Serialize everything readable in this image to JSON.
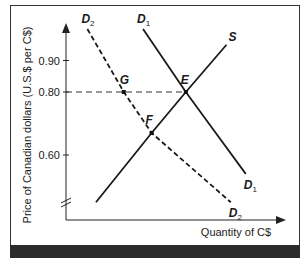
{
  "chart_data": {
    "type": "line",
    "title": "",
    "xlabel": "Quantity of C$",
    "ylabel": "Price of Canadian dollars (U.S.$ per C$)",
    "y_ticks": [
      {
        "value": 0.9,
        "label": "0.90"
      },
      {
        "value": 0.8,
        "label": "0.80"
      },
      {
        "value": 0.6,
        "label": "0.60"
      }
    ],
    "y_axis_break": true,
    "ylim": [
      0.43,
      1.0
    ],
    "xlim": [
      0,
      10
    ],
    "grid": false,
    "series": [
      {
        "name": "D2",
        "label_main": "D",
        "label_sub": "2",
        "style": "dashed",
        "points": [
          [
            1.0,
            1.0
          ],
          [
            2.7,
            0.8
          ],
          [
            4.0,
            0.67
          ],
          [
            7.7,
            0.45
          ]
        ]
      },
      {
        "name": "D1",
        "label_main": "D",
        "label_sub": "1",
        "style": "solid",
        "points": [
          [
            3.6,
            1.0
          ],
          [
            5.6,
            0.8
          ],
          [
            7.0,
            0.67
          ],
          [
            8.4,
            0.54
          ]
        ]
      },
      {
        "name": "S",
        "label_main": "S",
        "label_sub": "",
        "style": "solid",
        "points": [
          [
            1.4,
            0.45
          ],
          [
            4.0,
            0.67
          ],
          [
            5.6,
            0.8
          ],
          [
            7.5,
            0.95
          ]
        ]
      }
    ],
    "points": [
      {
        "name": "G",
        "x": 2.7,
        "y": 0.8
      },
      {
        "name": "E",
        "x": 5.6,
        "y": 0.8
      },
      {
        "name": "F",
        "x": 4.0,
        "y": 0.67
      }
    ],
    "reference_lines": [
      {
        "from_x": 0,
        "to_x": 5.6,
        "y": 0.8,
        "style": "dashed"
      }
    ]
  }
}
